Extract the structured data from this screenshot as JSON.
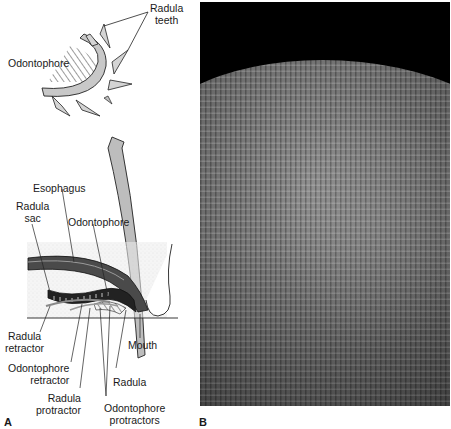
{
  "panel_a": {
    "letter": "A",
    "top_detail": {
      "labels": {
        "radula_teeth_line1": "Radula",
        "radula_teeth_line2": "teeth",
        "odontophore": "Odontophore"
      }
    },
    "section": {
      "labels": {
        "esophagus": "Esophagus",
        "radula_sac_line1": "Radula",
        "radula_sac_line2": "sac",
        "odontophore": "Odontophore",
        "radula_retractor_line1": "Radula",
        "radula_retractor_line2": "retractor",
        "mouth": "Mouth",
        "odontophore_retractor_line1": "Odontophore",
        "odontophore_retractor_line2": "retractor",
        "radula": "Radula",
        "radula_protractor_line1": "Radula",
        "radula_protractor_line2": "protractor",
        "odontophore_protractors_line1": "Odontophore",
        "odontophore_protractors_line2": "protractors"
      }
    }
  },
  "panel_b": {
    "letter": "B"
  },
  "colors": {
    "line": "#1a1a1a",
    "arrow_fill": "#bdbdbd",
    "tissue_fill": "#e6e6e6",
    "photo_background": "#000000"
  }
}
